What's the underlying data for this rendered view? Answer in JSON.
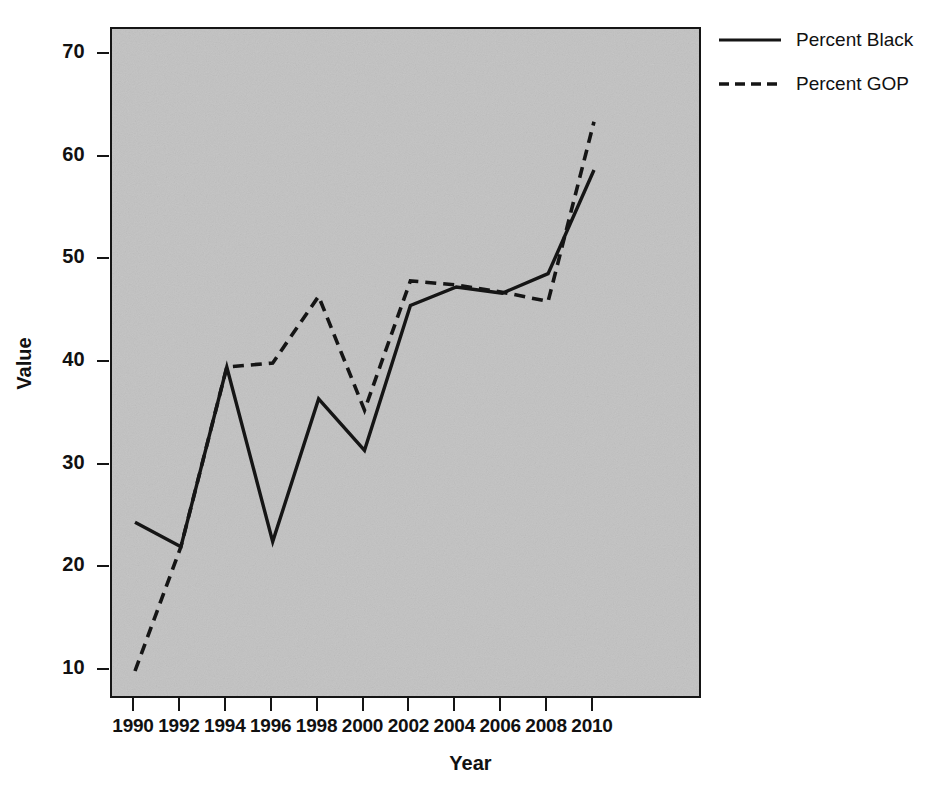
{
  "chart_data": {
    "type": "line",
    "title": "",
    "xlabel": "Year",
    "ylabel": "Value",
    "x": [
      1990,
      1992,
      1994,
      1996,
      1998,
      2000,
      2002,
      2004,
      2006,
      2008,
      2010
    ],
    "xtick_labels": [
      "1990",
      "1992",
      "1994",
      "1996",
      "1998",
      "2000",
      "2002",
      "2004",
      "2006",
      "2008",
      "2010"
    ],
    "ytick_labels": [
      "70",
      "60",
      "50",
      "40",
      "30",
      "20",
      "10"
    ],
    "yticks": [
      70,
      60,
      50,
      40,
      30,
      20,
      10
    ],
    "xlim": [
      1989.0,
      2011.0
    ],
    "ylim": [
      7.4,
      72.4
    ],
    "grid": false,
    "legend_position": "right",
    "plot_background": "#c2c2c2",
    "line_color": "#151515",
    "series": [
      {
        "name": "Percent Black",
        "style": "solid",
        "values": [
          24.5,
          22.1,
          39.6,
          22.6,
          36.5,
          31.5,
          45.6,
          47.4,
          46.8,
          48.7,
          58.8
        ]
      },
      {
        "name": "Percent GOP",
        "style": "dashed",
        "values": [
          10.0,
          22.1,
          39.6,
          40.0,
          46.5,
          35.4,
          48.0,
          47.6,
          46.9,
          46.0,
          63.5
        ]
      }
    ]
  },
  "legend": {
    "items": [
      {
        "label": "Percent Black",
        "style": "solid"
      },
      {
        "label": "Percent GOP",
        "style": "dashed"
      }
    ]
  },
  "axes": {
    "x_title": "Year",
    "y_title": "Value"
  }
}
